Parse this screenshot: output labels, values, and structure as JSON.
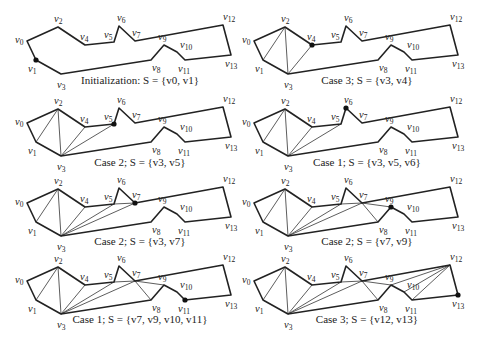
{
  "figure": {
    "vertices": [
      "v0",
      "v1",
      "v2",
      "v3",
      "v4",
      "v5",
      "v6",
      "v7",
      "v8",
      "v9",
      "v10",
      "v11",
      "v12",
      "v13"
    ],
    "polygon_order": [
      0,
      2,
      4,
      5,
      6,
      7,
      12,
      13,
      11,
      10,
      9,
      8,
      3,
      1
    ],
    "panels": [
      {
        "id": "init",
        "caption_prefix": "Initialization: ",
        "caption_set": "S = {v0, v1}",
        "case": "Initialization",
        "stack": [
          "v0",
          "v1"
        ],
        "current": "v1",
        "diagonals": []
      },
      {
        "id": "case3-a",
        "caption_prefix": "Case 3; ",
        "caption_set": "S = {v3, v4}",
        "case": "Case 3",
        "stack": [
          "v3",
          "v4"
        ],
        "current": "v4",
        "diagonals": [
          [
            "v1",
            "v2"
          ],
          [
            "v2",
            "v3"
          ],
          [
            "v3",
            "v4"
          ]
        ]
      },
      {
        "id": "case2-a",
        "caption_prefix": "Case 2; ",
        "caption_set": "S = {v3, v5}",
        "case": "Case 2",
        "stack": [
          "v3",
          "v5"
        ],
        "current": "v5",
        "diagonals": [
          [
            "v1",
            "v2"
          ],
          [
            "v2",
            "v3"
          ],
          [
            "v3",
            "v4"
          ],
          [
            "v3",
            "v5"
          ]
        ]
      },
      {
        "id": "case1-a",
        "caption_prefix": "Case 1; ",
        "caption_set": "S = {v3, v5, v6}",
        "case": "Case 1",
        "stack": [
          "v3",
          "v5",
          "v6"
        ],
        "current": "v6",
        "diagonals": [
          [
            "v1",
            "v2"
          ],
          [
            "v2",
            "v3"
          ],
          [
            "v3",
            "v4"
          ],
          [
            "v3",
            "v5"
          ]
        ]
      },
      {
        "id": "case2-b",
        "caption_prefix": "Case 2; ",
        "caption_set": "S = {v3, v7}",
        "case": "Case 2",
        "stack": [
          "v3",
          "v7"
        ],
        "current": "v7",
        "diagonals": [
          [
            "v1",
            "v2"
          ],
          [
            "v2",
            "v3"
          ],
          [
            "v3",
            "v4"
          ],
          [
            "v3",
            "v5"
          ],
          [
            "v3",
            "v7"
          ],
          [
            "v5",
            "v7"
          ]
        ]
      },
      {
        "id": "case2-c",
        "caption_prefix": "Case 2; ",
        "caption_set": "S = {v7, v9}",
        "case": "Case 2",
        "stack": [
          "v7",
          "v9"
        ],
        "current": "v9",
        "diagonals": [
          [
            "v1",
            "v2"
          ],
          [
            "v2",
            "v3"
          ],
          [
            "v3",
            "v4"
          ],
          [
            "v3",
            "v5"
          ],
          [
            "v3",
            "v7"
          ],
          [
            "v5",
            "v7"
          ],
          [
            "v7",
            "v8"
          ],
          [
            "v7",
            "v9"
          ]
        ]
      },
      {
        "id": "case1-b",
        "caption_prefix": "Case 1; ",
        "caption_set": "S = {v7, v9, v10, v11}",
        "case": "Case 1",
        "stack": [
          "v7",
          "v9",
          "v10",
          "v11"
        ],
        "current": "v11",
        "diagonals": [
          [
            "v1",
            "v2"
          ],
          [
            "v2",
            "v3"
          ],
          [
            "v3",
            "v4"
          ],
          [
            "v3",
            "v5"
          ],
          [
            "v3",
            "v7"
          ],
          [
            "v5",
            "v7"
          ],
          [
            "v7",
            "v8"
          ],
          [
            "v7",
            "v9"
          ]
        ]
      },
      {
        "id": "case3-b",
        "caption_prefix": "Case 3; ",
        "caption_set": "S = {v12, v13}",
        "case": "Case 3",
        "stack": [
          "v12",
          "v13"
        ],
        "current": "v13",
        "diagonals": [
          [
            "v1",
            "v2"
          ],
          [
            "v2",
            "v3"
          ],
          [
            "v3",
            "v4"
          ],
          [
            "v3",
            "v5"
          ],
          [
            "v3",
            "v7"
          ],
          [
            "v5",
            "v7"
          ],
          [
            "v7",
            "v8"
          ],
          [
            "v7",
            "v9"
          ],
          [
            "v9",
            "v12"
          ],
          [
            "v10",
            "v12"
          ],
          [
            "v11",
            "v12"
          ]
        ]
      }
    ]
  }
}
